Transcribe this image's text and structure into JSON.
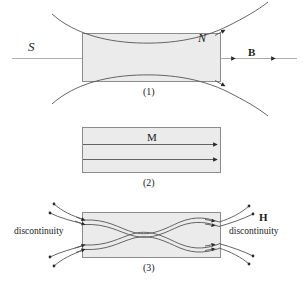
{
  "figure": {
    "colors": {
      "slab_fill": "#ebebeb",
      "slab_stroke": "#8c8c8c",
      "field_line": "#555555",
      "axis_line": "#9a9a9a",
      "marker": "#2b2b2b",
      "text": "#1a1a1a",
      "background": "#ffffff"
    },
    "panels": [
      {
        "id": "panel-1",
        "caption": "(1)",
        "quantity": "B",
        "slab": {
          "x": 82,
          "y": 33,
          "width": 139,
          "height": 49
        },
        "labels": [
          {
            "name": "pole-label-south",
            "text": "S",
            "style": "italic-serif",
            "x": 28,
            "y": 40
          },
          {
            "name": "pole-label-north",
            "text": "N",
            "style": "italic-serif",
            "x": 198,
            "y": 32
          },
          {
            "name": "field-label-b",
            "text": "B",
            "style": "bold-serif",
            "x": 248,
            "y": 47
          }
        ]
      },
      {
        "id": "panel-2",
        "caption": "(2)",
        "quantity": "M",
        "slab": {
          "x": 82,
          "y": 127,
          "width": 139,
          "height": 46
        },
        "labels": [
          {
            "name": "field-label-m",
            "text": "M",
            "style": "serif",
            "x": 147,
            "y": 132
          }
        ]
      },
      {
        "id": "panel-3",
        "caption": "(3)",
        "quantity": "H",
        "slab": {
          "x": 82,
          "y": 212,
          "width": 139,
          "height": 46
        },
        "labels": [
          {
            "name": "discontinuity-label-left",
            "text": "discontinuity",
            "style": "serif",
            "x": 14,
            "y": 227
          },
          {
            "name": "discontinuity-label-right",
            "text": "discontinuity",
            "style": "serif",
            "x": 229,
            "y": 227
          },
          {
            "name": "field-label-h",
            "text": "H",
            "style": "bold-serif",
            "x": 259,
            "y": 212
          }
        ]
      }
    ],
    "captions": {
      "panel_1": "(1)",
      "panel_2": "(2)",
      "panel_3": "(3)"
    }
  }
}
